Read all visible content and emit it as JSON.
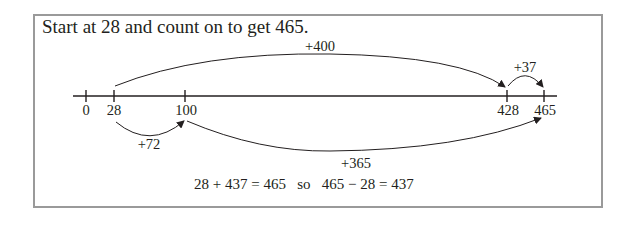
{
  "title": "Start at 28 and count on to get 465.",
  "number_line": {
    "ticks": [
      {
        "value": "0"
      },
      {
        "value": "28"
      },
      {
        "value": "100"
      },
      {
        "value": "428"
      },
      {
        "value": "465"
      }
    ]
  },
  "jumps": {
    "top_big": "+400",
    "top_small": "+37",
    "bottom_small": "+72",
    "bottom_big": "+365"
  },
  "equation": "28 + 437 = 465   so   465 − 28 = 437",
  "colors": {
    "border": "#9a9a9a",
    "ink": "#231f20"
  }
}
